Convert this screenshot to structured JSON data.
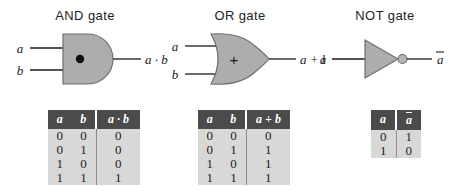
{
  "figure": {
    "type": "logic-gate-reference",
    "background": "#ffffff",
    "gate_fill": "#adadad",
    "gate_stroke": "#6e6e6e",
    "header_bg": "#4b4b4b",
    "table_bg": "#d8d8d6"
  },
  "gates": [
    {
      "id": "and",
      "title": "AND gate",
      "symbol": "·",
      "inputs": [
        "a",
        "b"
      ],
      "output": "a · b",
      "shape": "d-shape",
      "inverted": false,
      "table": {
        "headers": [
          "a",
          "b",
          "a · b"
        ],
        "rows": [
          [
            "0",
            "0",
            "0"
          ],
          [
            "0",
            "1",
            "0"
          ],
          [
            "1",
            "0",
            "0"
          ],
          [
            "1",
            "1",
            "1"
          ]
        ]
      }
    },
    {
      "id": "or",
      "title": "OR gate",
      "symbol": "+",
      "inputs": [
        "a",
        "b"
      ],
      "output": "a + b",
      "shape": "shield-shape",
      "inverted": false,
      "table": {
        "headers": [
          "a",
          "b",
          "a + b"
        ],
        "rows": [
          [
            "0",
            "0",
            "0"
          ],
          [
            "0",
            "1",
            "1"
          ],
          [
            "1",
            "0",
            "1"
          ],
          [
            "1",
            "1",
            "1"
          ]
        ]
      }
    },
    {
      "id": "not",
      "title": "NOT gate",
      "symbol": "",
      "inputs": [
        "a"
      ],
      "output": "a",
      "output_overbar": true,
      "shape": "triangle-bubble",
      "inverted": true,
      "table": {
        "headers": [
          "a",
          "a"
        ],
        "header_overbar": [
          false,
          true
        ],
        "rows": [
          [
            "0",
            "1"
          ],
          [
            "1",
            "0"
          ]
        ]
      }
    }
  ]
}
